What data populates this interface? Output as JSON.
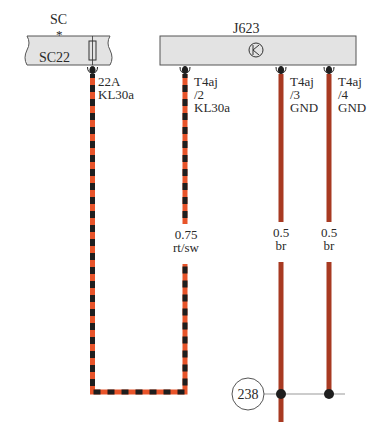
{
  "components": {
    "fuse_holder": {
      "ref": "SC",
      "marker": "*",
      "fuse": "SC22"
    },
    "control_unit": {
      "ref": "J623",
      "symbol": "transistor-symbol"
    }
  },
  "pins": [
    {
      "id": "fuse_out",
      "line1": "22A",
      "line2": "KL30a",
      "line3": ""
    },
    {
      "id": "t4aj_2",
      "line1": "T4aj",
      "line2": "/2",
      "line3": "KL30a"
    },
    {
      "id": "t4aj_3",
      "line1": "T4aj",
      "line2": "/3",
      "line3": "GND"
    },
    {
      "id": "t4aj_4",
      "line1": "T4aj",
      "line2": "/4",
      "line3": "GND"
    }
  ],
  "wires": [
    {
      "id": "kl30a",
      "size": "0.75",
      "color_code": "rt/sw",
      "colors": [
        "#e8542a",
        "#1e1e1e"
      ]
    },
    {
      "id": "gnd_3",
      "size": "0.5",
      "color_code": "br",
      "colors": [
        "#a83a22"
      ]
    },
    {
      "id": "gnd_4",
      "size": "0.5",
      "color_code": "br",
      "colors": [
        "#a83a22"
      ]
    }
  ],
  "ground_point": {
    "ref": "238"
  },
  "colors": {
    "box_fill": "#e3e3e3",
    "box_stroke": "#555555",
    "red": "#e8542a",
    "black": "#1e1e1e",
    "brown": "#a83a22"
  }
}
